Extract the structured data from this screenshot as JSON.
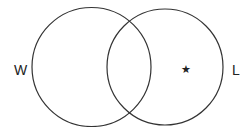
{
  "diagram": {
    "type": "venn",
    "background": "#ffffff",
    "stroke_color": "#333333",
    "sets": [
      {
        "label": "W",
        "position": "left"
      },
      {
        "label": "L",
        "position": "right"
      }
    ],
    "marker": {
      "symbol": "★",
      "region": "L only"
    }
  }
}
